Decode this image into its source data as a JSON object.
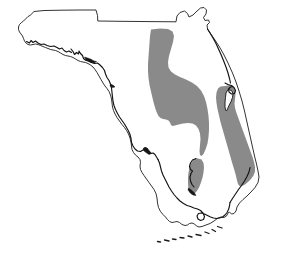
{
  "figure": {
    "kind": "distribution-map",
    "caption": "",
    "title": "",
    "background_color": "#ffffff",
    "outline_color": "#1c1c1c",
    "shade_color": "#8a8a8a",
    "width": 284,
    "height": 269
  },
  "map": {
    "region_name": "Florida",
    "outline": {
      "name": "florida-state-outline",
      "stroke": "#1c1c1c",
      "fill": "#ffffff",
      "path": "M 30 30 L 28 26 L 34 22 L 66 20 L 112 19 L 150 18 L 160 17 L 160 24 L 162 28 L 170 28 L 174 25 L 180 26 L 183 22 L 188 20 L 192 16 L 198 14 L 204 15 L 206 20 L 205 26 L 210 27 L 213 24 L 215 27 L 212 32 L 214 38 L 220 44 L 228 54 L 236 66 L 244 80 L 252 96 L 258 112 L 262 128 L 265 142 L 268 156 L 270 168 L 269 178 L 264 190 L 256 200 L 248 208 L 240 214 L 232 218 L 226 220 L 220 220 L 214 218 L 210 214 L 206 212 L 202 214 L 200 218 L 196 222 L 190 226 L 182 230 L 174 233 L 166 234 L 158 233 L 150 230 L 144 226 L 140 220 L 138 212 L 136 204 L 132 196 L 128 190 L 124 184 L 120 178 L 116 172 L 112 166 L 108 160 L 104 154 L 100 148 L 96 142 L 92 136 L 90 128 L 90 120 L 92 112 L 94 104 L 94 96 L 92 90 L 88 86 L 84 84 L 78 84 L 72 82 L 66 78 L 60 76 L 54 76 L 48 74 L 42 70 L 38 66 L 34 62 L 30 58 L 26 52 L 24 46 L 26 40 L 30 36 Z"
    },
    "shaded_ranges": [
      {
        "name": "central-peninsula-range",
        "label": "Central ridge distribution band",
        "color": "#8a8a8a"
      },
      {
        "name": "atlantic-coast-range",
        "label": "Atlantic coastal distribution band",
        "color": "#8a8a8a"
      },
      {
        "name": "southwest-gulf-coast-range",
        "label": "Southwest Gulf coast distribution band",
        "color": "#8a8a8a"
      }
    ],
    "features": [
      {
        "name": "northern-state-border",
        "label": "Straight northern border with Georgia and Alabama"
      },
      {
        "name": "panhandle",
        "label": "Florida panhandle"
      },
      {
        "name": "big-bend-coast",
        "label": "Big Bend Gulf coast"
      },
      {
        "name": "tampa-bay",
        "label": "Tampa Bay indentation on the Gulf coast"
      },
      {
        "name": "charlotte-harbor",
        "label": "Charlotte Harbor indentation"
      },
      {
        "name": "indian-river-lagoon",
        "label": "Indian River lagoon along the Atlantic coast"
      },
      {
        "name": "florida-keys",
        "label": "Florida Keys island chain"
      },
      {
        "name": "florida-bay",
        "label": "Florida Bay at the southern tip"
      }
    ]
  }
}
